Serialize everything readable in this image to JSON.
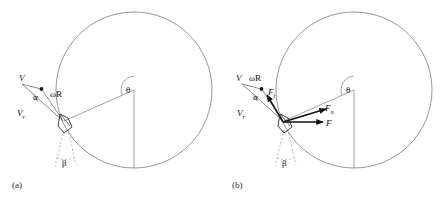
{
  "figure": {
    "background": "#ffffff",
    "stroke_light": "#8a8a8a",
    "stroke_dark": "#1a1a1a",
    "panels": [
      {
        "id": "a",
        "caption": "(a)",
        "labels": {
          "velocity": "V",
          "relative_velocity": "V",
          "relative_velocity_sub": "r",
          "tip_speed": "ωR",
          "alpha": "α",
          "beta": "β",
          "theta": "θ"
        }
      },
      {
        "id": "b",
        "caption": "(b)",
        "labels": {
          "velocity": "V",
          "relative_velocity": "V",
          "relative_velocity_sub": "r",
          "tip_speed": "ωR",
          "alpha": "α",
          "beta": "β",
          "theta": "θ",
          "force_tangential": "F",
          "force_tangential_sub": "t",
          "force_normal": "F",
          "force_normal_sub": "n",
          "force_resultant": "F"
        }
      }
    ]
  },
  "geometry": {
    "circle": {
      "cx": 134,
      "cy": 90,
      "r": 78
    },
    "blade": {
      "x": 62,
      "y": 122
    },
    "vertical_radius_end": {
      "x": 134,
      "y": 168
    }
  }
}
